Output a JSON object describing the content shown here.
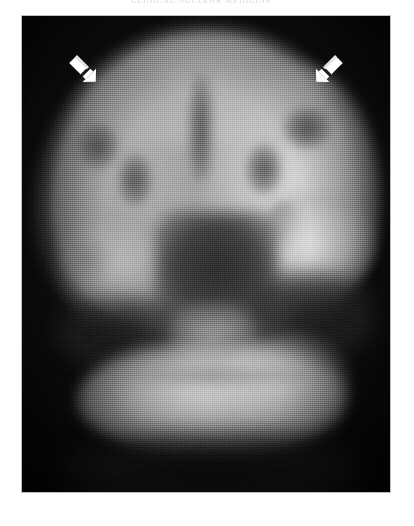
{
  "figure": {
    "caption_top": "CLINICAL NUCLEAR MEDICINE",
    "modality_label": "coronal brain perfusion scan",
    "plate": {
      "background_color": "#0a0a0a",
      "page_color": "#ffffff",
      "frame_color": "#bfbfbf",
      "left": 22,
      "top": 16,
      "width": 368,
      "height": 476
    }
  },
  "annotations": {
    "arrow_color": "#ffffff",
    "markers": [
      {
        "name": "left-frontal-arrow",
        "label": "arrow",
        "points": "down-right",
        "target": "left frontal cortex",
        "x": 38,
        "y": 30
      },
      {
        "name": "right-frontal-arrow",
        "label": "arrow",
        "points": "down-left",
        "target": "right frontal cortex",
        "x": 284,
        "y": 30
      }
    ]
  },
  "anatomy": {
    "regions": [
      {
        "id": "cerebrum",
        "label": "cerebral hemispheres",
        "intensity": "high"
      },
      {
        "id": "cortex-right",
        "label": "right cortical ribbon",
        "intensity": "very high"
      },
      {
        "id": "cortex-left",
        "label": "left cortical ribbon",
        "intensity": "moderate"
      },
      {
        "id": "midline-fissure",
        "label": "interhemispheric fissure",
        "intensity": "low"
      },
      {
        "id": "temporal-right",
        "label": "right temporal lobe",
        "intensity": "very high"
      },
      {
        "id": "temporal-left",
        "label": "left temporal lobe",
        "intensity": "moderate"
      },
      {
        "id": "central-dark",
        "label": "ventricles / central cistern",
        "intensity": "very low"
      },
      {
        "id": "brainstem",
        "label": "brainstem",
        "intensity": "moderate"
      },
      {
        "id": "cerebellum",
        "label": "cerebellum",
        "intensity": "very high"
      }
    ]
  }
}
